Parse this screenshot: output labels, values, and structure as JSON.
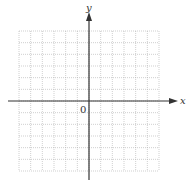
{
  "figure": {
    "type": "cartesian-grid",
    "x_axis_label": "x",
    "y_axis_label": "y",
    "origin_label": "0",
    "grid": {
      "columns": 12,
      "rows": 12,
      "line_style": "dotted"
    },
    "colors": {
      "axis": "#333333",
      "grid": "#b0b0b0",
      "background": "#ffffff"
    }
  }
}
